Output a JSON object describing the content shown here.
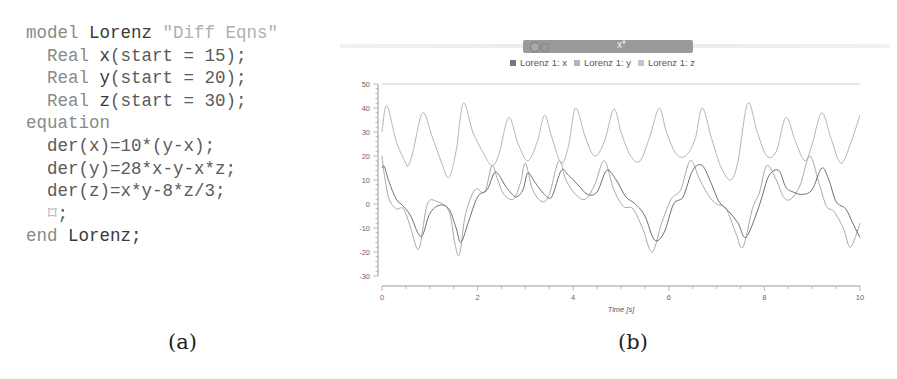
{
  "code": {
    "lines": [
      {
        "indent": "",
        "parts": [
          {
            "cls": "kw",
            "text": "model "
          },
          {
            "cls": "id",
            "text": "Lorenz "
          },
          {
            "cls": "str",
            "text": "\"Diff Eqns\""
          }
        ]
      },
      {
        "indent": "  ",
        "parts": [
          {
            "cls": "kw",
            "text": "Real "
          },
          {
            "cls": "id",
            "text": "x"
          },
          {
            "cls": "plain",
            "text": "(start = 15);"
          }
        ]
      },
      {
        "indent": "  ",
        "parts": [
          {
            "cls": "kw",
            "text": "Real "
          },
          {
            "cls": "id",
            "text": "y"
          },
          {
            "cls": "plain",
            "text": "(start = 20);"
          }
        ]
      },
      {
        "indent": "  ",
        "parts": [
          {
            "cls": "kw",
            "text": "Real "
          },
          {
            "cls": "id",
            "text": "z"
          },
          {
            "cls": "plain",
            "text": "(start = 30);"
          }
        ]
      },
      {
        "indent": "",
        "parts": [
          {
            "cls": "kw",
            "text": "equation"
          }
        ]
      },
      {
        "indent": "  ",
        "parts": [
          {
            "cls": "plain",
            "text": "der(x)=10*(y-x);"
          }
        ]
      },
      {
        "indent": "  ",
        "parts": [
          {
            "cls": "plain",
            "text": "der(y)=28*x-y-x*z;"
          }
        ]
      },
      {
        "indent": "  ",
        "parts": [
          {
            "cls": "plain",
            "text": "der(z)=x*y-8*z/3;"
          }
        ]
      },
      {
        "indent": "  ",
        "parts": [
          {
            "cls": "str",
            "text": "⌑"
          },
          {
            "cls": "plain",
            "text": ";"
          }
        ]
      },
      {
        "indent": "",
        "parts": [
          {
            "cls": "kw",
            "text": "end "
          },
          {
            "cls": "id",
            "text": "Lorenz;"
          }
        ]
      }
    ]
  },
  "captions": {
    "a": "(a)",
    "b": "(b)"
  },
  "window": {
    "title": "x*",
    "icons": [
      "close-icon",
      "document-icon"
    ]
  },
  "legend": [
    {
      "label": "Lorenz 1: x",
      "color": "#777777"
    },
    {
      "label": "Lorenz 1: y",
      "color": "#b5b5b5"
    },
    {
      "label": "Lorenz 1: z",
      "color": "#c4c4c4"
    }
  ],
  "chart_data": {
    "type": "line",
    "title": "",
    "xlabel": "Time [s]",
    "ylabel": "",
    "xlim": [
      0,
      10
    ],
    "ylim": [
      -30,
      50
    ],
    "xticks": [
      0,
      2,
      4,
      6,
      8,
      10
    ],
    "yticks": [
      50,
      40,
      30,
      20,
      10,
      0,
      -10,
      -20,
      -30
    ],
    "grid": false,
    "legend_position": "top",
    "series": [
      {
        "name": "Lorenz 1: x",
        "color": "#6f6f6f",
        "x": [
          0,
          0.05,
          0.15,
          0.3,
          0.45,
          0.6,
          0.75,
          0.85,
          1.0,
          1.2,
          1.4,
          1.55,
          1.65,
          1.8,
          2.0,
          2.2,
          2.35,
          2.45,
          2.6,
          2.8,
          2.95,
          3.05,
          3.2,
          3.4,
          3.55,
          3.75,
          3.9,
          4.1,
          4.3,
          4.5,
          4.7,
          4.9,
          5.1,
          5.3,
          5.5,
          5.7,
          5.9,
          6.1,
          6.3,
          6.5,
          6.7,
          6.9,
          7.05,
          7.25,
          7.45,
          7.6,
          7.8,
          7.95,
          8.1,
          8.3,
          8.45,
          8.6,
          8.8,
          9.0,
          9.2,
          9.35,
          9.5,
          9.7,
          9.85,
          10.0
        ],
        "values": [
          15,
          15.5,
          9,
          2,
          -1,
          -5,
          -12,
          -13,
          -4,
          -0.5,
          -2,
          -10,
          -16,
          -8,
          3,
          6,
          13,
          12,
          7,
          3,
          6,
          13,
          9,
          4,
          3,
          14,
          12,
          8,
          4,
          5,
          14,
          10,
          3,
          0,
          -5,
          -15,
          -12,
          0,
          3,
          14,
          16,
          8,
          1,
          -3,
          -8,
          -14,
          -6,
          3,
          12,
          14,
          7,
          5,
          4,
          6,
          15,
          10,
          1,
          -2,
          -8,
          -14
        ]
      },
      {
        "name": "Lorenz 1: y",
        "color": "#a8a8a8",
        "x": [
          0,
          0.05,
          0.15,
          0.3,
          0.45,
          0.6,
          0.72,
          0.8,
          0.95,
          1.15,
          1.4,
          1.52,
          1.62,
          1.75,
          1.95,
          2.15,
          2.3,
          2.42,
          2.55,
          2.75,
          2.9,
          3.0,
          3.15,
          3.35,
          3.5,
          3.7,
          3.85,
          4.05,
          4.25,
          4.45,
          4.65,
          4.85,
          5.05,
          5.25,
          5.45,
          5.65,
          5.85,
          6.05,
          6.25,
          6.45,
          6.65,
          6.85,
          7.0,
          7.2,
          7.4,
          7.55,
          7.75,
          7.9,
          8.05,
          8.25,
          8.4,
          8.55,
          8.75,
          8.95,
          9.15,
          9.3,
          9.45,
          9.65,
          9.8,
          10.0
        ],
        "values": [
          20,
          12,
          2,
          -2,
          -2,
          -10,
          -18,
          -17,
          0,
          1,
          -3,
          -16,
          -21,
          -4,
          6,
          5,
          16,
          10,
          4,
          2,
          9,
          17,
          6,
          1,
          4,
          18,
          10,
          4,
          2,
          8,
          18,
          6,
          -1,
          -2,
          -10,
          -20,
          -8,
          2,
          6,
          18,
          10,
          3,
          0,
          -2,
          -12,
          -18,
          -2,
          5,
          16,
          10,
          3,
          2,
          8,
          20,
          8,
          -1,
          -3,
          -10,
          -18,
          -8
        ]
      },
      {
        "name": "Lorenz 1: z",
        "color": "#b5b5b5",
        "x": [
          0,
          0.1,
          0.3,
          0.5,
          0.55,
          0.65,
          0.85,
          1.05,
          1.25,
          1.4,
          1.55,
          1.7,
          1.9,
          2.1,
          2.3,
          2.45,
          2.65,
          2.85,
          3.05,
          3.25,
          3.4,
          3.55,
          3.75,
          3.9,
          4.05,
          4.25,
          4.45,
          4.65,
          4.85,
          5.0,
          5.2,
          5.4,
          5.6,
          5.8,
          5.95,
          6.15,
          6.35,
          6.55,
          6.7,
          6.9,
          7.1,
          7.3,
          7.45,
          7.65,
          7.85,
          8.05,
          8.25,
          8.45,
          8.65,
          8.85,
          9.0,
          9.2,
          9.4,
          9.6,
          9.8,
          10.0
        ],
        "values": [
          30,
          41,
          26,
          17,
          16,
          22,
          38,
          28,
          17,
          11,
          22,
          42,
          30,
          22,
          16,
          21,
          36,
          25,
          18,
          26,
          37,
          28,
          17,
          24,
          40,
          28,
          20,
          26,
          39.5,
          30,
          20,
          18,
          28,
          40,
          30,
          21,
          20,
          27,
          40,
          27,
          15,
          10,
          18,
          42,
          30,
          20,
          22,
          36,
          26,
          18,
          25,
          38,
          27,
          17,
          25,
          37
        ]
      }
    ]
  }
}
